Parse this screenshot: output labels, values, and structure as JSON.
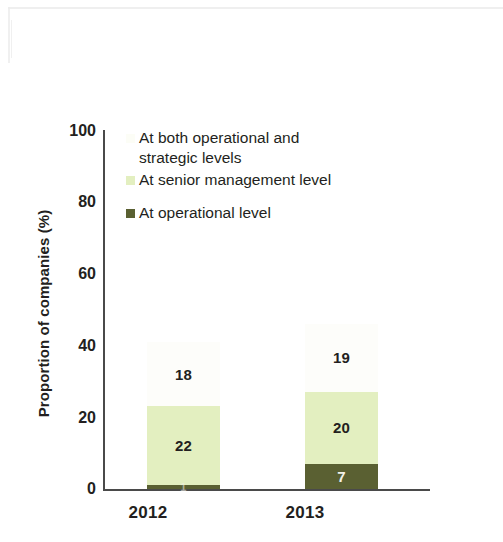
{
  "chart_data": {
    "type": "bar",
    "subtype": "stacked-bar",
    "title": "",
    "xlabel": "",
    "ylabel": "Proportion of companies (%)",
    "categories": [
      "2012",
      "2013"
    ],
    "ylim": [
      0,
      100
    ],
    "yticks": [
      "0",
      "20",
      "40",
      "60",
      "80",
      "100"
    ],
    "grid": false,
    "legend_position": "inside-top-left",
    "series": [
      {
        "name": "At operational level",
        "color": "#5a6032",
        "values": [
          1,
          7
        ],
        "labels": [
          "1",
          "7"
        ],
        "stack_order": 0
      },
      {
        "name": "At senior management level",
        "color": "#e3efc0",
        "values": [
          22,
          20
        ],
        "labels": [
          "22",
          "20"
        ],
        "stack_order": 1
      },
      {
        "name": "At both operational and strategic levels",
        "color": "#fdfdfa",
        "values": [
          18,
          19
        ],
        "labels": [
          "18",
          "19"
        ],
        "stack_order": 2
      }
    ]
  },
  "legend": {
    "entries": [
      {
        "label_line1": "At both operational and",
        "label_line2": "strategic levels",
        "swatch": "white-swatch-icon"
      },
      {
        "label_line1": "At senior management level",
        "label_line2": "",
        "swatch": "light-green-swatch-icon"
      },
      {
        "label_line1": "At operational level",
        "label_line2": "",
        "swatch": "dark-olive-swatch-icon"
      }
    ]
  },
  "axis": {
    "y_title": "Proportion of companies (%)",
    "y_ticks": [
      "100",
      "80",
      "60",
      "40",
      "20",
      "0"
    ],
    "x_ticks": [
      "2012",
      "2013"
    ]
  },
  "colors": {
    "light_green": "#e3efc0",
    "dark_olive": "#5a6032",
    "white_segment": "#fdfdfa",
    "axis": "#4a4a4a",
    "text": "#231f20"
  }
}
